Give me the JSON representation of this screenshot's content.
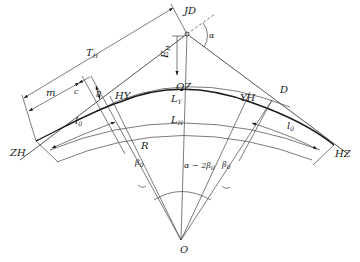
{
  "diagram": {
    "points": {
      "JD": "JD",
      "ZH": "ZH",
      "HY": "HY",
      "QZ": "QZ",
      "YH": "YH",
      "HZ": "HZ",
      "D": "D",
      "O": "O"
    },
    "dimensions": {
      "TH": "T",
      "TH_sub": "H",
      "EH": "E",
      "EH_sub": "H",
      "m": "m",
      "c": "c",
      "p": "p",
      "LY": "L",
      "LY_sub": "Y",
      "LH": "L",
      "LH_sub": "H",
      "l0_left": "l",
      "l0_left_sub": "0",
      "l0_right": "l",
      "l0_right_sub": "0",
      "R": "R"
    },
    "angles": {
      "alpha": "α",
      "beta0_left": "β",
      "beta0_left_sub": "0",
      "beta0_right": "β",
      "beta0_right_sub": "0",
      "center_angle": "α − 2β",
      "center_angle_sub": "0"
    }
  }
}
